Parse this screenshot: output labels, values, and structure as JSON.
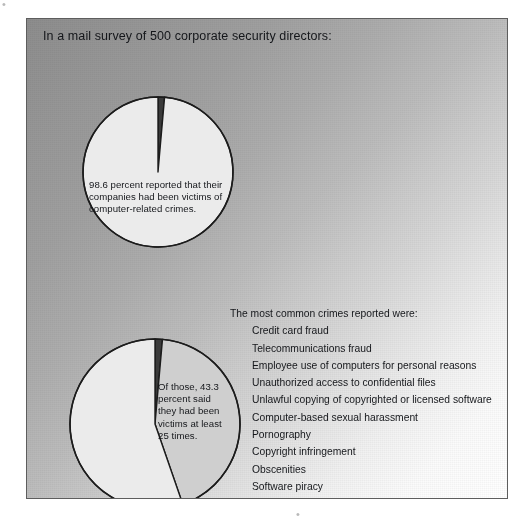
{
  "headline": "In a mail survey of 500 corporate security directors:",
  "pies": [
    {
      "name": "victims-of-computer-crime",
      "caption": "98.6 percent reported that their companies had been victims of computer-related crimes.",
      "center": {
        "x": 102,
        "y": 101
      },
      "radius": 75,
      "slices": [
        {
          "label": "Reported victims",
          "value": 98.6,
          "color": "#ebebeb"
        },
        {
          "label": "Not victims",
          "value": 1.4,
          "color": "#3a3a3a"
        }
      ]
    },
    {
      "name": "victims-at-least-25-times",
      "caption": "Of those, 43.3 percent said they had been victims at least 25 times.",
      "center": {
        "x": 111,
        "y": 89
      },
      "radius": 85,
      "slices": [
        {
          "label": "Victims at least 25 times",
          "value": 43.3,
          "color": "#cfcfcf"
        },
        {
          "label": "Fewer than 25 times",
          "value": 55.3,
          "color": "#efefef"
        },
        {
          "label": "Gap",
          "value": 1.4,
          "color": "#3a3a3a"
        }
      ]
    }
  ],
  "crimes": {
    "title": "The most common crimes reported were:",
    "items": [
      "Credit card fraud",
      "Telecommunications fraud",
      "Employee use of computers for personal reasons",
      "Unauthorized access to confidential files",
      "Unlawful copying of copyrighted or licensed software",
      "Computer-based sexual harassment",
      "Pornography",
      "Copyright infringement",
      "Obscenities",
      "Software piracy",
      "Communication of trade secrets to external audiences"
    ]
  },
  "colors": {
    "stroke": "#1c1c1c",
    "text": "#15171b",
    "panel_border": "#5d5d5d",
    "pie_light": "#ebebeb",
    "pie_gray": "#cfcfcf",
    "pie_dark": "#3a3a3a"
  },
  "scan_marks": {
    "top_left": "•",
    "bottom": "•"
  },
  "chart_data": [
    {
      "type": "pie",
      "title": "98.6 percent reported that their companies had been victims of computer-related crimes.",
      "categories": [
        "Reported victims of computer-related crimes",
        "Did not report"
      ],
      "values": [
        98.6,
        1.4
      ],
      "units": "percent",
      "legend": "none",
      "note": "Base: 500 corporate security directors surveyed by mail"
    },
    {
      "type": "pie",
      "title": "Of those, 43.3 percent said they had been victims at least 25 times.",
      "categories": [
        "Victims at least 25 times",
        "Victims fewer than 25 times"
      ],
      "values": [
        43.3,
        56.7
      ],
      "units": "percent",
      "legend": "none",
      "note": "Base: respondents who reported being victims"
    },
    {
      "type": "table",
      "title": "The most common crimes reported were:",
      "categories": [
        "Credit card fraud",
        "Telecommunications fraud",
        "Employee use of computers for personal reasons",
        "Unauthorized access to confidential files",
        "Unlawful copying of copyrighted or licensed software",
        "Computer-based sexual harassment",
        "Pornography",
        "Copyright infringement",
        "Obscenities",
        "Software piracy",
        "Communication of trade secrets to external audiences"
      ],
      "values": []
    }
  ]
}
